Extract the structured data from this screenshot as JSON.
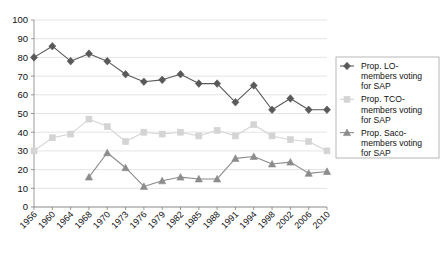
{
  "chart_data": {
    "type": "line",
    "title": "",
    "subtitle": "",
    "xlabel": "",
    "ylabel": "",
    "ylim": [
      0,
      100
    ],
    "ytick_step": 10,
    "yticks": [
      0,
      10,
      20,
      30,
      40,
      50,
      60,
      70,
      80,
      90,
      100
    ],
    "grid": true,
    "grid_orientation": "horizontal",
    "legend_position": "right",
    "categories": [
      "1956",
      "1960",
      "1964",
      "1968",
      "1970",
      "1973",
      "1976",
      "1979",
      "1982",
      "1985",
      "1988",
      "1991",
      "1994",
      "1998",
      "2002",
      "2006",
      "2010"
    ],
    "series": [
      {
        "name": "Prop. LO-members voting for SAP",
        "marker": "diamond",
        "color": "#595959",
        "values": [
          80,
          86,
          78,
          82,
          78,
          71,
          67,
          68,
          71,
          66,
          66,
          56,
          65,
          52,
          58,
          52,
          52
        ]
      },
      {
        "name": "Prop. TCO-members voting for SAP",
        "marker": "square",
        "color": "#d4d4d4",
        "values": [
          30,
          37,
          39,
          47,
          43,
          35,
          40,
          39,
          40,
          38,
          41,
          38,
          44,
          38,
          36,
          35,
          30
        ]
      },
      {
        "name": "Prop. Saco-members voting for SAP",
        "marker": "triangle",
        "color": "#8c8c8c",
        "values": [
          null,
          null,
          null,
          16,
          29,
          21,
          11,
          14,
          16,
          15,
          15,
          26,
          27,
          23,
          24,
          18,
          19
        ]
      }
    ]
  },
  "legend": {
    "entries": [
      {
        "label": "Prop. LO-members voting for SAP",
        "marker": "diamond",
        "color": "#595959"
      },
      {
        "label": "Prop. TCO-members voting for SAP",
        "marker": "square",
        "color": "#d4d4d4"
      },
      {
        "label": "Prop. Saco-members voting for SAP",
        "marker": "triangle",
        "color": "#8c8c8c"
      }
    ],
    "lines": [
      [
        "Prop. LO-",
        "members voting",
        "for SAP"
      ],
      [
        "Prop. TCO-",
        "members voting",
        "for SAP"
      ],
      [
        "Prop. Saco-",
        "members voting",
        "for SAP"
      ]
    ]
  },
  "colors": {
    "series_lo": "#595959",
    "series_tco": "#d4d4d4",
    "series_saco": "#8c8c8c",
    "grid": "#d9d9d9",
    "axis": "#808080",
    "text": "#111111",
    "background": "#ffffff"
  }
}
